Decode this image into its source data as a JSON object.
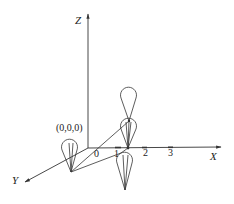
{
  "diagram": {
    "axes": {
      "x_label": "X",
      "y_label": "Y",
      "z_label": "Z"
    },
    "ticks": [
      "0",
      "1",
      "2",
      "3"
    ],
    "origin_label": "(0,0,0)",
    "colors": {
      "stroke": "#333333",
      "text": "#222222"
    }
  }
}
